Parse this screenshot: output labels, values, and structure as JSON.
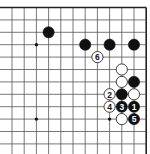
{
  "diagram": {
    "type": "go-board-fragment",
    "corner": "top-right",
    "columns": 12,
    "rows": 12,
    "grid": {
      "x0": 12,
      "dx": 12.2,
      "y0": 7.5,
      "dy": 12.4,
      "line_color": "#555555",
      "border_color": "#222222",
      "background": "#ffffff"
    },
    "edges": {
      "top": true,
      "right": true,
      "left": false,
      "bottom": false
    },
    "star_points": [
      {
        "col": 3,
        "row": 4
      },
      {
        "col": 9,
        "row": 4
      },
      {
        "col": 3,
        "row": 10
      },
      {
        "col": 9,
        "row": 10
      }
    ],
    "stones": [
      {
        "col": 4,
        "row": 3,
        "color": "black",
        "label": ""
      },
      {
        "col": 7,
        "row": 4,
        "color": "black",
        "label": ""
      },
      {
        "col": 9,
        "row": 4,
        "color": "black",
        "label": ""
      },
      {
        "col": 11,
        "row": 4,
        "color": "black",
        "label": ""
      },
      {
        "col": 8,
        "row": 5,
        "color": "white",
        "label": "6"
      },
      {
        "col": 10,
        "row": 6,
        "color": "white",
        "label": ""
      },
      {
        "col": 10,
        "row": 7,
        "color": "white",
        "label": ""
      },
      {
        "col": 11,
        "row": 7,
        "color": "black",
        "label": ""
      },
      {
        "col": 9,
        "row": 8,
        "color": "white",
        "label": "2"
      },
      {
        "col": 10,
        "row": 8,
        "color": "black",
        "label": ""
      },
      {
        "col": 11,
        "row": 8,
        "color": "white",
        "label": ""
      },
      {
        "col": 9,
        "row": 9,
        "color": "white",
        "label": "4"
      },
      {
        "col": 10,
        "row": 9,
        "color": "black",
        "label": "3"
      },
      {
        "col": 11,
        "row": 9,
        "color": "black",
        "label": "1"
      },
      {
        "col": 10,
        "row": 10,
        "color": "white",
        "label": ""
      },
      {
        "col": 11,
        "row": 10,
        "color": "black",
        "label": "5"
      }
    ],
    "move_sequence": [
      {
        "move": 1,
        "color": "black",
        "col": 11,
        "row": 9
      },
      {
        "move": 2,
        "color": "white",
        "col": 9,
        "row": 8
      },
      {
        "move": 3,
        "color": "black",
        "col": 10,
        "row": 9
      },
      {
        "move": 4,
        "color": "white",
        "col": 9,
        "row": 9
      },
      {
        "move": 5,
        "color": "black",
        "col": 11,
        "row": 10
      },
      {
        "move": 6,
        "color": "white",
        "col": 8,
        "row": 5
      }
    ]
  }
}
